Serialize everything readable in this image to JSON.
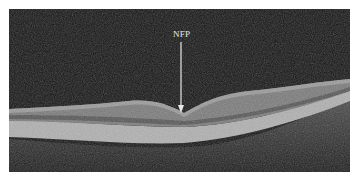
{
  "figure": {
    "type": "OCT retinal cross-section scan",
    "annotation": {
      "label": "NFP",
      "arrow_direction": "down",
      "color": "#e8e8e8"
    },
    "colors": {
      "background": "#141414",
      "retina_layers": [
        "#5a5a5a",
        "#8c8c8c",
        "#b4b4b4",
        "#6e6e6e"
      ],
      "border": "#ffffff"
    }
  }
}
